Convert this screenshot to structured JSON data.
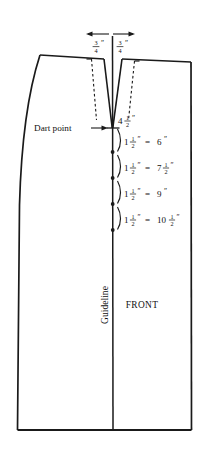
{
  "figure": {
    "name": "front-skirt-dart-pattern-diagram",
    "type": "sewing-pattern-technical-drawing",
    "background_color": "#ffffff",
    "line_color": "#1a1a1a",
    "text_color": "#111111"
  },
  "top_measurements": {
    "left": {
      "whole": "",
      "numerator": "3",
      "denominator": "4",
      "unit": "″",
      "full": "3/4″"
    },
    "right": {
      "whole": "",
      "numerator": "3",
      "denominator": "4",
      "unit": "″",
      "full": "3/4″"
    },
    "arrow_left_name": "dimension-arrow-left",
    "arrow_right_name": "dimension-arrow-right"
  },
  "dart": {
    "point_label": "Dart point",
    "depth": {
      "whole": "4",
      "numerator": "1",
      "denominator": "2",
      "unit": "″",
      "full": "4 1/2″"
    }
  },
  "spacing_rows": [
    {
      "spacing": {
        "whole": "1",
        "numerator": "1",
        "denominator": "2",
        "unit": "″"
      },
      "equals": "=",
      "result": {
        "whole": "6",
        "numerator": "",
        "denominator": "",
        "unit": "″"
      },
      "full": "1 1/2″ = 6″"
    },
    {
      "spacing": {
        "whole": "1",
        "numerator": "1",
        "denominator": "2",
        "unit": "″"
      },
      "equals": "=",
      "result": {
        "whole": "7",
        "numerator": "1",
        "denominator": "2",
        "unit": "″"
      },
      "full": "1 1/2″ = 7 1/2″"
    },
    {
      "spacing": {
        "whole": "1",
        "numerator": "1",
        "denominator": "2",
        "unit": "″"
      },
      "equals": "=",
      "result": {
        "whole": "9",
        "numerator": "",
        "denominator": "",
        "unit": "″"
      },
      "full": "1 1/2″ = 9″"
    },
    {
      "spacing": {
        "whole": "1",
        "numerator": "1",
        "denominator": "2",
        "unit": "″"
      },
      "equals": "=",
      "result": {
        "whole": "10",
        "numerator": "1",
        "denominator": "2",
        "unit": "″"
      },
      "full": "1 1/2″ = 10 1/2″"
    }
  ],
  "labels": {
    "guideline": "Guideline",
    "front": "FRONT"
  }
}
